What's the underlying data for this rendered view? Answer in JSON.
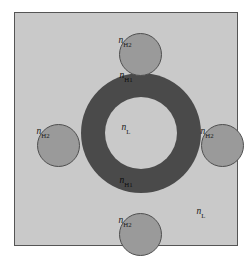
{
  "figure": {
    "type": "cross-section-diagram",
    "canvas": {
      "width": 251,
      "height": 259,
      "background": "#ffffff"
    }
  },
  "colors": {
    "substrate_fill": "#c9c9c9",
    "substrate_border": "#555555",
    "ring_fill": "#4a4a4a",
    "core_fill": "#c9c9c9",
    "satellite_fill": "#9a9a9a",
    "satellite_border": "#4f4f4f",
    "label_text": "#1a1a1a"
  },
  "regions": {
    "substrate": {
      "name": "substrate",
      "label_main": "n",
      "label_sub": "L",
      "fill": "#c9c9c9"
    },
    "ring": {
      "name": "high-index-ring",
      "label_main": "n",
      "label_sub": "H1",
      "fill": "#4a4a4a"
    },
    "core": {
      "name": "low-index-core",
      "label_main": "n",
      "label_sub": "L",
      "fill": "#c9c9c9"
    },
    "satellite": {
      "name": "satellite-rod",
      "label_main": "n",
      "label_sub": "H2",
      "fill": "#9a9a9a"
    }
  },
  "labels": [
    {
      "id": "ring-top",
      "main": "n",
      "sub": "H1",
      "x": 126,
      "y": 76,
      "region": "ring"
    },
    {
      "id": "ring-bottom",
      "main": "n",
      "sub": "H1",
      "x": 126,
      "y": 181,
      "region": "ring"
    },
    {
      "id": "core",
      "main": "n",
      "sub": "L",
      "x": 126,
      "y": 128,
      "region": "core"
    },
    {
      "id": "sat-top",
      "main": "n",
      "sub": "H2",
      "x": 125,
      "y": 41,
      "region": "satellite"
    },
    {
      "id": "sat-bottom",
      "main": "n",
      "sub": "H2",
      "x": 125,
      "y": 221,
      "region": "satellite"
    },
    {
      "id": "sat-left",
      "main": "n",
      "sub": "H2",
      "x": 43,
      "y": 132,
      "region": "satellite"
    },
    {
      "id": "sat-right",
      "main": "n",
      "sub": "H2",
      "x": 207,
      "y": 132,
      "region": "satellite"
    },
    {
      "id": "substrate",
      "main": "n",
      "sub": "L",
      "x": 201,
      "y": 212,
      "region": "substrate"
    }
  ],
  "geometry": {
    "substrate": {
      "x": 14,
      "y": 12,
      "w": 224,
      "h": 234
    },
    "ring_outer": {
      "cx": 126,
      "cy": 120,
      "r": 60
    },
    "ring_inner": {
      "cx": 126,
      "cy": 120,
      "r": 36
    },
    "satellites": [
      {
        "id": "top",
        "cx": 125.5,
        "cy": 41.5,
        "r": 21.5
      },
      {
        "id": "bottom",
        "cx": 125.5,
        "cy": 221.5,
        "r": 21.5
      },
      {
        "id": "left",
        "cx": 43.5,
        "cy": 132.5,
        "r": 21.5
      },
      {
        "id": "right",
        "cx": 207.5,
        "cy": 132.5,
        "r": 21.5
      }
    ]
  }
}
